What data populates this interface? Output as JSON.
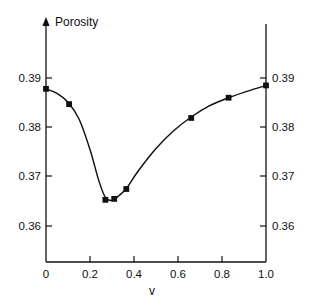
{
  "figure": {
    "background_color": "#ffffff",
    "ink_color": "#111111",
    "top_artifact_text": ""
  },
  "chart_data": {
    "type": "line",
    "title": "",
    "subtitle": "",
    "xlabel": "v",
    "ylabel": "Porosity",
    "ylabel_position": "top-left-above-axis",
    "xlim": [
      0,
      1.0
    ],
    "ylim": [
      0.3535,
      0.3955
    ],
    "grid": false,
    "legend": null,
    "legend_position": "none",
    "x_ticks": [
      0,
      0.2,
      0.4,
      0.6,
      0.8,
      1.0
    ],
    "x_tick_labels": [
      "0",
      "0.2",
      "0.4",
      "0.6",
      "0.8",
      "1.0"
    ],
    "y_ticks": [
      0.36,
      0.37,
      0.38,
      0.39
    ],
    "y_tick_labels_left": [
      "0.36",
      "0.37",
      "0.38",
      "0.39"
    ],
    "y_tick_labels_right": [
      "0.36",
      "0.37",
      "0.38",
      "0.39"
    ],
    "tick_direction": "in",
    "mirrored_y_axis": true,
    "marker_style": "filled-square",
    "series": [
      {
        "name": "Porosity vs v",
        "x": [
          0.0,
          0.105,
          0.27,
          0.31,
          0.365,
          0.66,
          0.83,
          1.0
        ],
        "values": [
          0.3878,
          0.3847,
          0.3653,
          0.3655,
          0.3675,
          0.3819,
          0.386,
          0.3885
        ]
      }
    ],
    "fit_curve": {
      "name": "smooth-spline-fit",
      "x": [
        0.0,
        0.05,
        0.1,
        0.15,
        0.2,
        0.24,
        0.27,
        0.3,
        0.33,
        0.365,
        0.42,
        0.5,
        0.58,
        0.66,
        0.74,
        0.83,
        0.92,
        1.0
      ],
      "y": [
        0.3878,
        0.3869,
        0.3851,
        0.3817,
        0.3755,
        0.3692,
        0.3658,
        0.3652,
        0.3661,
        0.3676,
        0.3712,
        0.3757,
        0.3793,
        0.3821,
        0.3843,
        0.386,
        0.3874,
        0.3885
      ]
    }
  },
  "axes": {
    "y_axis_arrow": true,
    "frame": "open-top-box"
  }
}
